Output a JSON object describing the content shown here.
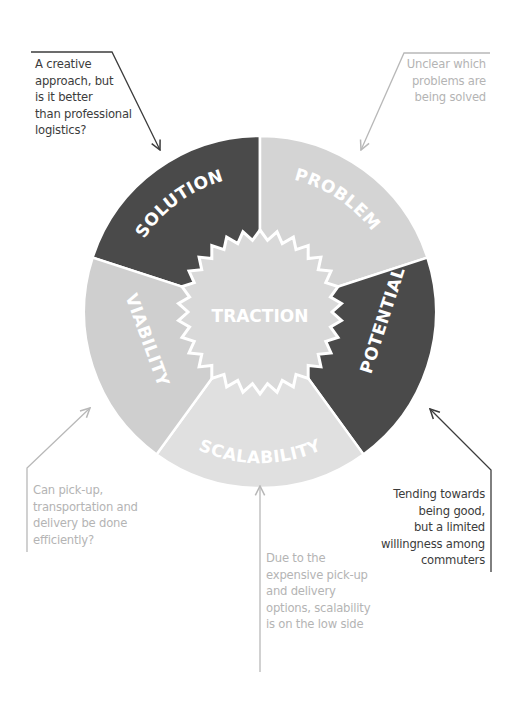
{
  "diagram": {
    "center": {
      "label": "TRACTION",
      "fill": "#d9d9d9"
    },
    "segments": [
      {
        "label": "SOLUTION",
        "fill": "#4a4a4a",
        "start_deg": -162,
        "end_deg": -90
      },
      {
        "label": "PROBLEM",
        "fill": "#d4d4d4",
        "start_deg": -90,
        "end_deg": -18
      },
      {
        "label": "POTENTIAL",
        "fill": "#4a4a4a",
        "start_deg": -18,
        "end_deg": 54
      },
      {
        "label": "SCALABILITY",
        "fill": "#e0e0e0",
        "start_deg": 54,
        "end_deg": 126
      },
      {
        "label": "VIABILITY",
        "fill": "#cfcfcf",
        "start_deg": 126,
        "end_deg": 198
      }
    ],
    "annotations": [
      {
        "target": "SOLUTION",
        "tone": "dark",
        "text": "A creative\napproach, but\nis it better\nthan professional\nlogistics?"
      },
      {
        "target": "PROBLEM",
        "tone": "light",
        "text": "Unclear which\nproblems are\nbeing solved"
      },
      {
        "target": "VIABILITY",
        "tone": "light",
        "text": "Can pick-up,\ntransportation and\ndelivery be done\nefficiently?"
      },
      {
        "target": "POTENTIAL",
        "tone": "dark",
        "text": "Tending towards\nbeing good,\nbut a limited\nwillingness among\ncommuters"
      },
      {
        "target": "SCALABILITY",
        "tone": "light",
        "text": "Due to the\nexpensive pick-up\nand delivery\noptions, scalability\nis on the low side"
      }
    ],
    "colors": {
      "dark_segment": "#4a4a4a",
      "light_segment": "#d4d4d4",
      "dark_text": "#3c3c3c",
      "light_text": "#b4b4b4",
      "dark_line": "#3c3c3c",
      "light_line": "#b8b8b8"
    }
  }
}
